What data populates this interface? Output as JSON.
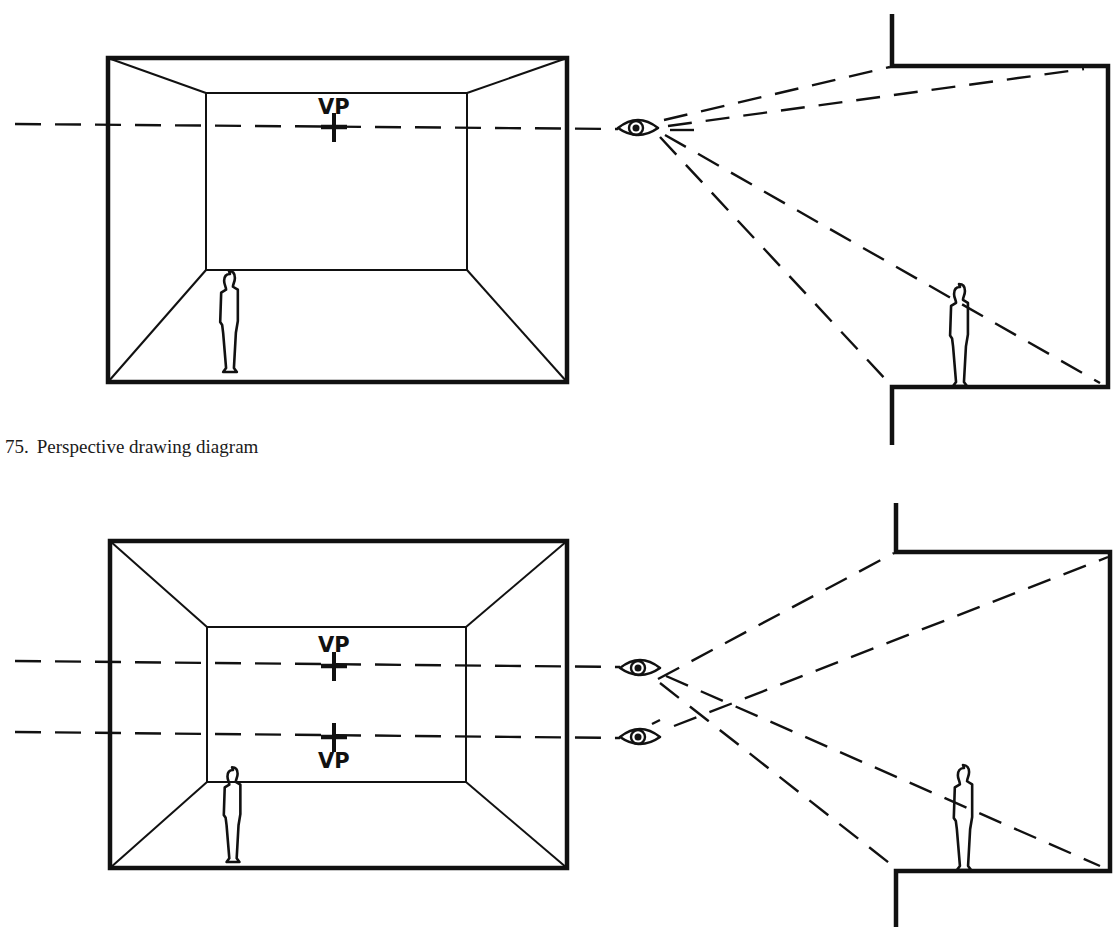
{
  "colors": {
    "ink": "#111111",
    "paper": "#ffffff"
  },
  "captions": [
    {
      "id": "fig75",
      "number": "75.",
      "text": "Perspective drawing diagram",
      "x": 5,
      "y": 438
    },
    {
      "id": "fig76",
      "number": "",
      "text": "",
      "x": 5,
      "y": 915
    }
  ],
  "figures": [
    {
      "name": "figure-75",
      "room_front": {
        "x1": 108,
        "y1": 58,
        "x2": 567,
        "y2": 382
      },
      "room_back": {
        "x1": 206,
        "y1": 93,
        "x2": 467,
        "y2": 270
      },
      "vanishing_points": [
        {
          "label": "VP",
          "cx": 334,
          "cy": 127,
          "label_x": 318,
          "label_y": 114,
          "label_pos": "above"
        }
      ],
      "sight_lines": [
        {
          "x1": 15,
          "y1": 124,
          "x2": 618,
          "y2": 129
        }
      ],
      "eyes": [
        {
          "cx": 638,
          "cy": 128
        }
      ],
      "person_front": {
        "x": 230,
        "y_top": 274,
        "y_bottom": 372
      },
      "section": {
        "wall_top_x": 892,
        "wall_top_y1": 14,
        "wall_top_y2": 66,
        "ceiling_y": 66,
        "right_x": 1108,
        "floor_y": 387,
        "wall_bottom_x": 892,
        "wall_bottom_y2": 445
      },
      "rays": [
        {
          "x1": 664,
          "y1": 120,
          "x2": 890,
          "y2": 67
        },
        {
          "x1": 668,
          "y1": 126,
          "x2": 1084,
          "y2": 69
        },
        {
          "x1": 660,
          "y1": 137,
          "x2": 888,
          "y2": 382
        },
        {
          "x1": 665,
          "y1": 135,
          "x2": 1100,
          "y2": 383
        },
        {
          "x1": 670,
          "y1": 130,
          "x2": 706,
          "y2": 130
        }
      ],
      "person_section": {
        "x": 960,
        "y_top": 287,
        "y_bottom": 386
      }
    },
    {
      "name": "figure-76",
      "room_front": {
        "x1": 110,
        "y1": 541,
        "x2": 567,
        "y2": 868
      },
      "room_back": {
        "x1": 207,
        "y1": 627,
        "x2": 466,
        "y2": 782
      },
      "vanishing_points": [
        {
          "label": "VP",
          "cx": 334,
          "cy": 666,
          "label_x": 318,
          "label_y": 652,
          "label_pos": "above"
        },
        {
          "label": "VP",
          "cx": 334,
          "cy": 737,
          "label_x": 318,
          "label_y": 768,
          "label_pos": "below"
        }
      ],
      "sight_lines": [
        {
          "x1": 15,
          "y1": 661,
          "x2": 620,
          "y2": 667
        },
        {
          "x1": 15,
          "y1": 732,
          "x2": 620,
          "y2": 738
        }
      ],
      "eyes": [
        {
          "cx": 640,
          "cy": 668
        },
        {
          "cx": 640,
          "cy": 737
        }
      ],
      "person_front": {
        "x": 233,
        "y_top": 770,
        "y_bottom": 862
      },
      "section": {
        "wall_top_x": 896,
        "wall_top_y1": 503,
        "wall_top_y2": 552,
        "ceiling_y": 552,
        "right_x": 1110,
        "floor_y": 871,
        "wall_bottom_x": 896,
        "wall_bottom_y2": 927
      },
      "rays": [
        {
          "x1": 658,
          "y1": 679,
          "x2": 894,
          "y2": 553
        },
        {
          "x1": 674,
          "y1": 726,
          "x2": 1108,
          "y2": 557
        },
        {
          "x1": 666,
          "y1": 676,
          "x2": 1100,
          "y2": 866
        },
        {
          "x1": 660,
          "y1": 683,
          "x2": 893,
          "y2": 866
        },
        {
          "x1": 652,
          "y1": 724,
          "x2": 660,
          "y2": 720
        }
      ],
      "person_section": {
        "x": 964,
        "y_top": 768,
        "y_bottom": 870
      }
    }
  ]
}
